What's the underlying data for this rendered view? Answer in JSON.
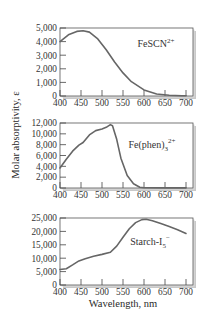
{
  "figure": {
    "ylabel": "Molar absorptivity, ε",
    "xlabel": "Wavelength, nm"
  },
  "chart_data": [
    {
      "type": "line",
      "title": "FeSCN²⁺",
      "label_main": "FeSCN",
      "label_sup": "2+",
      "xlabel": "Wavelength, nm",
      "ylabel": "Molar absorptivity, ε",
      "xlim": [
        400,
        700
      ],
      "ylim": [
        0,
        5000
      ],
      "x_ticks": [
        400,
        450,
        500,
        550,
        600,
        650,
        700
      ],
      "y_ticks": [
        0,
        1000,
        2000,
        3000,
        4000,
        5000
      ],
      "y_tick_labels": [
        "0",
        "1,000",
        "2,000",
        "3,000",
        "4,000",
        "5,000"
      ],
      "grid": false,
      "series": [
        {
          "name": "FeSCN2+",
          "x": [
            400,
            420,
            440,
            455,
            470,
            490,
            510,
            530,
            550,
            570,
            600,
            630,
            660,
            690,
            700
          ],
          "y": [
            4000,
            4500,
            4750,
            4800,
            4700,
            4200,
            3400,
            2500,
            1700,
            1050,
            450,
            150,
            50,
            20,
            20
          ]
        }
      ]
    },
    {
      "type": "line",
      "title": "Fe(phen)₃²⁺",
      "label_main": "Fe(phen)",
      "label_sub": "3",
      "label_sup": "2+",
      "xlabel": "Wavelength, nm",
      "ylabel": "Molar absorptivity, ε",
      "xlim": [
        400,
        700
      ],
      "ylim": [
        0,
        12000
      ],
      "x_ticks": [
        400,
        450,
        500,
        550,
        600,
        650,
        700
      ],
      "y_ticks": [
        0,
        2000,
        4000,
        6000,
        8000,
        10000,
        12000
      ],
      "y_tick_labels": [
        "0",
        "2,000",
        "4,000",
        "6,000",
        "8,000",
        "10,000",
        "12,000"
      ],
      "grid": false,
      "series": [
        {
          "name": "Fe(phen)3 2+",
          "x": [
            400,
            415,
            430,
            445,
            455,
            470,
            485,
            500,
            510,
            520,
            525,
            535,
            545,
            560,
            575,
            590,
            600,
            650,
            700
          ],
          "y": [
            3700,
            5300,
            6800,
            7900,
            8400,
            9800,
            10600,
            10900,
            11200,
            11700,
            11500,
            9000,
            5500,
            2300,
            800,
            150,
            50,
            20,
            20
          ]
        }
      ]
    },
    {
      "type": "line",
      "title": "Starch-I₅⁻",
      "label_main": "Starch-I",
      "label_sub": "5",
      "label_sup": "−",
      "xlabel": "Wavelength, nm",
      "ylabel": "Molar absorptivity, ε",
      "xlim": [
        400,
        700
      ],
      "ylim": [
        0,
        25000
      ],
      "x_ticks": [
        400,
        450,
        500,
        550,
        600,
        650,
        700
      ],
      "y_ticks": [
        0,
        5000,
        10000,
        15000,
        20000,
        25000
      ],
      "y_tick_labels": [
        "0",
        "5,000",
        "10,000",
        "15,000",
        "20,000",
        "25,000"
      ],
      "grid": false,
      "series": [
        {
          "name": "Starch-I5-",
          "x": [
            400,
            415,
            430,
            445,
            460,
            480,
            500,
            520,
            535,
            550,
            565,
            580,
            595,
            605,
            620,
            640,
            660,
            680,
            700
          ],
          "y": [
            5800,
            6100,
            7500,
            9000,
            9800,
            10700,
            11400,
            12200,
            14500,
            17800,
            21000,
            23300,
            24400,
            24500,
            24000,
            22900,
            21800,
            20600,
            19200
          ]
        }
      ]
    }
  ]
}
